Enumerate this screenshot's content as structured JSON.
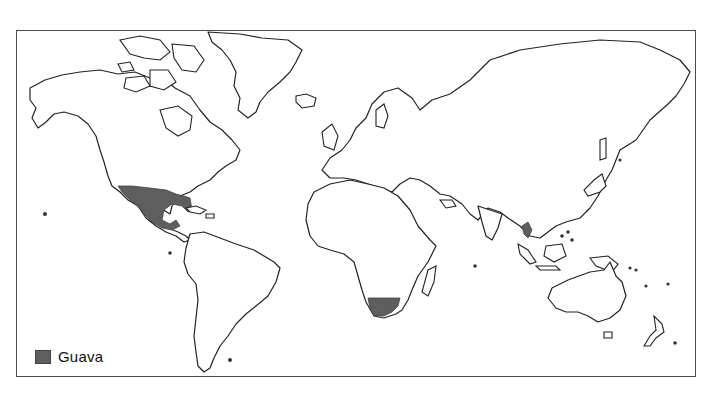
{
  "map": {
    "type": "world-distribution-map",
    "projection": "mercator-style world outline",
    "highlight_color": "#5e5e5e",
    "outline_color": "#222222",
    "highlighted_regions": [
      {
        "name": "Mexico and southern United States"
      },
      {
        "name": "Southern Africa"
      },
      {
        "name": "Southeast Asia (Vietnam / Indochina)"
      }
    ]
  },
  "legend": {
    "items": [
      {
        "label": "Guava",
        "color": "#5e5e5e",
        "icon": "filled-square-swatch"
      }
    ]
  }
}
